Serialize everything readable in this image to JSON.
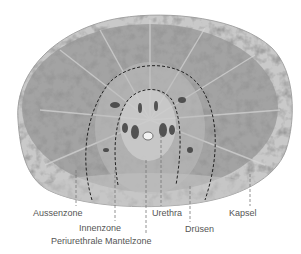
{
  "figure": {
    "colors": {
      "tissue_light": "#b9b9b9",
      "tissue_dark": "#5a5a5a",
      "capsule": "#d2d2d2",
      "label_text": "#555555",
      "leader_line": "#777777",
      "zone_boundary": "#222222"
    },
    "labels": [
      {
        "id": "aussenzone",
        "text": "Aussenzone",
        "x": 33,
        "y": 208,
        "line_x": 76,
        "line_y1": 170,
        "line_y2": 206
      },
      {
        "id": "innenzone",
        "text": "Innenzone",
        "x": 79,
        "y": 223,
        "line_x": 115,
        "line_y1": 170,
        "line_y2": 221
      },
      {
        "id": "periurethrale-mantelzone",
        "text": "Periurethrale Mantelzone",
        "x": 51,
        "y": 236,
        "line_x": 146,
        "line_y1": 160,
        "line_y2": 234
      },
      {
        "id": "urethra",
        "text": "Urethra",
        "x": 152,
        "y": 208,
        "line_x": 161,
        "line_y1": 135,
        "line_y2": 206
      },
      {
        "id": "druesen",
        "text": "Drüsen",
        "x": 185,
        "y": 224,
        "line_x": 190,
        "line_y1": 186,
        "line_y2": 222
      },
      {
        "id": "kapsel",
        "text": "Kapsel",
        "x": 229,
        "y": 208,
        "line_x": 250,
        "line_y1": 174,
        "line_y2": 206
      }
    ]
  }
}
